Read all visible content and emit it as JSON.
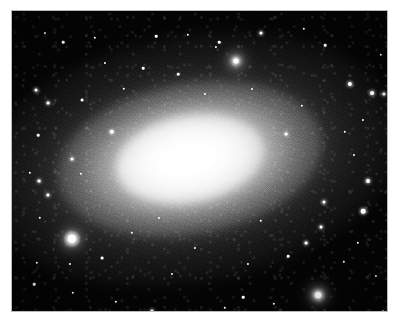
{
  "image": {
    "subject": "elliptical galaxy",
    "description": "Black-and-white astronomical photograph of a bright elliptical galaxy with a smooth, elongated luminous core, a grainy resolved-star halo, and a scattering of foreground stars on a black sky background.",
    "orientation": "landscape",
    "color_mode": "grayscale",
    "background_color": "#ffffff",
    "sky_color": "#040404",
    "core_color": "#ffffff",
    "border_color": "#b9b9b9",
    "plate": {
      "left": 12,
      "top": 11,
      "width": 375,
      "height": 300
    },
    "galaxy": {
      "center_x": 178,
      "center_y": 148,
      "position_angle_deg": -10,
      "core_width": 150,
      "core_height": 88,
      "halo_width": 430,
      "halo_height": 250
    },
    "stars": [
      {
        "x": 60,
        "y": 228,
        "r": 4.2,
        "class": "bigglow",
        "halo": 17
      },
      {
        "x": 306,
        "y": 284,
        "r": 2.8,
        "class": "bigglow",
        "halo": 10
      },
      {
        "x": 224,
        "y": 50,
        "r": 2.6,
        "class": "bigglow",
        "halo": 9
      },
      {
        "x": 351,
        "y": 200,
        "r": 2.3,
        "class": "glow",
        "halo": 0
      },
      {
        "x": 356,
        "y": 170,
        "r": 2.0,
        "class": "glow",
        "halo": 0
      },
      {
        "x": 100,
        "y": 121,
        "r": 2.2,
        "class": "glow",
        "halo": 0
      },
      {
        "x": 338,
        "y": 73,
        "r": 2.1,
        "class": "glow",
        "halo": 0
      },
      {
        "x": 360,
        "y": 82,
        "r": 1.9,
        "class": "glow",
        "halo": 0
      },
      {
        "x": 372,
        "y": 83,
        "r": 1.6,
        "class": "glow",
        "halo": 0
      },
      {
        "x": 249,
        "y": 22,
        "r": 1.5,
        "class": "glow",
        "halo": 0
      },
      {
        "x": 207,
        "y": 31,
        "r": 1.3,
        "class": "",
        "halo": 0
      },
      {
        "x": 176,
        "y": 24,
        "r": 1.2,
        "class": "",
        "halo": 0
      },
      {
        "x": 144,
        "y": 25,
        "r": 1.3,
        "class": "",
        "halo": 0
      },
      {
        "x": 83,
        "y": 27,
        "r": 1.2,
        "class": "",
        "halo": 0
      },
      {
        "x": 51,
        "y": 31,
        "r": 1.3,
        "class": "",
        "halo": 0
      },
      {
        "x": 33,
        "y": 22,
        "r": 1.1,
        "class": "",
        "halo": 0
      },
      {
        "x": 292,
        "y": 18,
        "r": 1.2,
        "class": "",
        "halo": 0
      },
      {
        "x": 313,
        "y": 34,
        "r": 1.3,
        "class": "",
        "halo": 0
      },
      {
        "x": 204,
        "y": 36,
        "r": 1.1,
        "class": "",
        "halo": 0
      },
      {
        "x": 24,
        "y": 79,
        "r": 1.5,
        "class": "glow",
        "halo": 0
      },
      {
        "x": 36,
        "y": 92,
        "r": 1.4,
        "class": "glow",
        "halo": 0
      },
      {
        "x": 27,
        "y": 170,
        "r": 1.4,
        "class": "glow",
        "halo": 0
      },
      {
        "x": 18,
        "y": 162,
        "r": 1.2,
        "class": "",
        "halo": 0
      },
      {
        "x": 36,
        "y": 184,
        "r": 1.6,
        "class": "glow",
        "halo": 0
      },
      {
        "x": 28,
        "y": 207,
        "r": 1.2,
        "class": "",
        "halo": 0
      },
      {
        "x": 26,
        "y": 124,
        "r": 1.3,
        "class": "",
        "halo": 0
      },
      {
        "x": 70,
        "y": 89,
        "r": 1.4,
        "class": "",
        "halo": 0
      },
      {
        "x": 60,
        "y": 148,
        "r": 1.5,
        "class": "glow",
        "halo": 0
      },
      {
        "x": 69,
        "y": 163,
        "r": 1.2,
        "class": "",
        "halo": 0
      },
      {
        "x": 25,
        "y": 252,
        "r": 1.2,
        "class": "",
        "halo": 0
      },
      {
        "x": 22,
        "y": 273,
        "r": 1.3,
        "class": "",
        "halo": 0
      },
      {
        "x": 61,
        "y": 282,
        "r": 1.2,
        "class": "",
        "halo": 0
      },
      {
        "x": 90,
        "y": 247,
        "r": 1.4,
        "class": "",
        "halo": 0
      },
      {
        "x": 120,
        "y": 222,
        "r": 1.2,
        "class": "",
        "halo": 0
      },
      {
        "x": 58,
        "y": 253,
        "r": 1.1,
        "class": "",
        "halo": 0
      },
      {
        "x": 104,
        "y": 291,
        "r": 1.2,
        "class": "",
        "halo": 0
      },
      {
        "x": 140,
        "y": 300,
        "r": 1.6,
        "class": "glow",
        "halo": 0
      },
      {
        "x": 197,
        "y": 303,
        "r": 1.2,
        "class": "",
        "halo": 0
      },
      {
        "x": 231,
        "y": 286,
        "r": 1.3,
        "class": "",
        "halo": 0
      },
      {
        "x": 213,
        "y": 297,
        "r": 1.2,
        "class": "",
        "halo": 0
      },
      {
        "x": 262,
        "y": 293,
        "r": 1.2,
        "class": "",
        "halo": 0
      },
      {
        "x": 276,
        "y": 245,
        "r": 1.3,
        "class": "",
        "halo": 0
      },
      {
        "x": 294,
        "y": 232,
        "r": 1.4,
        "class": "glow",
        "halo": 0
      },
      {
        "x": 309,
        "y": 216,
        "r": 1.5,
        "class": "glow",
        "halo": 0
      },
      {
        "x": 312,
        "y": 191,
        "r": 1.5,
        "class": "glow",
        "halo": 0
      },
      {
        "x": 332,
        "y": 251,
        "r": 1.2,
        "class": "",
        "halo": 0
      },
      {
        "x": 346,
        "y": 232,
        "r": 1.2,
        "class": "",
        "halo": 0
      },
      {
        "x": 364,
        "y": 265,
        "r": 1.1,
        "class": "",
        "halo": 0
      },
      {
        "x": 249,
        "y": 210,
        "r": 1.2,
        "class": "",
        "halo": 0
      },
      {
        "x": 236,
        "y": 253,
        "r": 1.1,
        "class": "",
        "halo": 0
      },
      {
        "x": 183,
        "y": 237,
        "r": 1.1,
        "class": "",
        "halo": 0
      },
      {
        "x": 160,
        "y": 263,
        "r": 1.1,
        "class": "",
        "halo": 0
      },
      {
        "x": 147,
        "y": 207,
        "r": 1.1,
        "class": "",
        "halo": 0
      },
      {
        "x": 274,
        "y": 123,
        "r": 1.4,
        "class": "glow",
        "halo": 0
      },
      {
        "x": 290,
        "y": 95,
        "r": 1.2,
        "class": "",
        "halo": 0
      },
      {
        "x": 333,
        "y": 121,
        "r": 1.2,
        "class": "",
        "halo": 0
      },
      {
        "x": 342,
        "y": 144,
        "r": 1.1,
        "class": "",
        "halo": 0
      },
      {
        "x": 351,
        "y": 109,
        "r": 1.1,
        "class": "",
        "halo": 0
      },
      {
        "x": 166,
        "y": 63,
        "r": 1.3,
        "class": "",
        "halo": 0
      },
      {
        "x": 131,
        "y": 57,
        "r": 1.3,
        "class": "",
        "halo": 0
      },
      {
        "x": 112,
        "y": 78,
        "r": 1.2,
        "class": "",
        "halo": 0
      },
      {
        "x": 193,
        "y": 83,
        "r": 1.1,
        "class": "",
        "halo": 0
      },
      {
        "x": 240,
        "y": 78,
        "r": 1.1,
        "class": "",
        "halo": 0
      },
      {
        "x": 93,
        "y": 52,
        "r": 1.1,
        "class": "",
        "halo": 0
      },
      {
        "x": 369,
        "y": 44,
        "r": 1.2,
        "class": "",
        "halo": 0
      },
      {
        "x": 378,
        "y": 130,
        "r": 1.1,
        "class": "",
        "halo": 0
      },
      {
        "x": 371,
        "y": 300,
        "r": 1.1,
        "class": "",
        "halo": 0
      }
    ]
  }
}
